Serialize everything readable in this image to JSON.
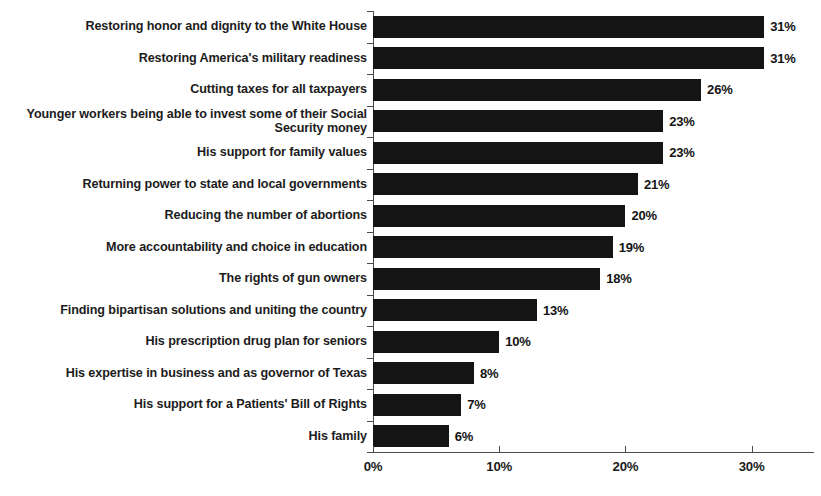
{
  "chart_data": {
    "type": "bar",
    "orientation": "horizontal",
    "title": "",
    "subtitle": "",
    "xlabel": "",
    "ylabel": "",
    "xlim": [
      0,
      35
    ],
    "grid": false,
    "legend": null,
    "value_suffix": "%",
    "bar_color": "#141414",
    "axis_color": "#4a4a4a",
    "background_color": "#ffffff",
    "xticks": [
      {
        "value": 0,
        "label": "0%"
      },
      {
        "value": 10,
        "label": "10%"
      },
      {
        "value": 20,
        "label": "20%"
      },
      {
        "value": 30,
        "label": "30%"
      }
    ],
    "categories": [
      "Restoring honor and dignity to the White House",
      "Restoring America's military readiness",
      "Cutting taxes for all taxpayers",
      "Younger workers being able to invest some of their Social Security money",
      "His support for family values",
      "Returning power to state and local governments",
      "Reducing the number of abortions",
      "More accountability and choice in education",
      "The rights of gun owners",
      "Finding bipartisan solutions and uniting the country",
      "His prescription drug plan for seniors",
      "His expertise in business and as governor of Texas",
      "His support for a Patients' Bill of Rights",
      "His family"
    ],
    "values": [
      31,
      31,
      26,
      23,
      23,
      21,
      20,
      19,
      18,
      13,
      10,
      8,
      7,
      6
    ],
    "data_labels": [
      "31%",
      "31%",
      "26%",
      "23%",
      "23%",
      "21%",
      "20%",
      "19%",
      "18%",
      "13%",
      "10%",
      "8%",
      "7%",
      "6%"
    ]
  }
}
